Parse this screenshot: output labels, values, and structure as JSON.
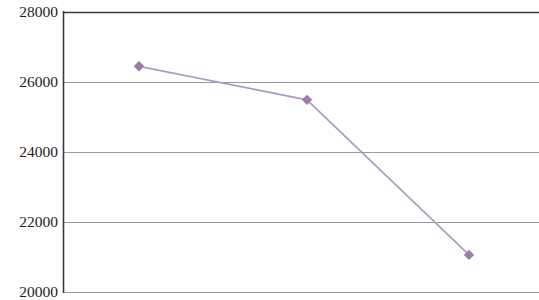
{
  "chart_data": {
    "type": "line",
    "title": "",
    "subtitle": "",
    "xlabel": "",
    "ylabel": "",
    "x": [
      1,
      2,
      3
    ],
    "values": [
      26450,
      25490,
      21060
    ],
    "series": [
      {
        "name": "",
        "values": [
          26450,
          25490,
          21060
        ]
      }
    ],
    "ytick_labels": [
      "28000",
      "26000",
      "24000",
      "22000",
      "20000"
    ],
    "ytick_values": [
      28000,
      26000,
      24000,
      22000,
      20000
    ],
    "xtick_labels": [],
    "ylim": [
      20000,
      28000
    ],
    "grid": "horizontal",
    "legend": "none",
    "line_color": "#b09cc0",
    "marker_color": "#9b7ba8",
    "marker_shape": "diamond",
    "axis_color": "#3a3a3a",
    "gridline_color": "#9a9a9a",
    "text_color": "#1d1d1d",
    "background_color": "#ffffff",
    "annotations": []
  },
  "axis": {
    "y_labels": [
      {
        "text": "28000",
        "value": 28000,
        "y": 12
      },
      {
        "text": "26000",
        "value": 26000,
        "y": 82
      },
      {
        "text": "24000",
        "value": 24000,
        "y": 152
      },
      {
        "text": "22000",
        "value": 22000,
        "y": 222
      },
      {
        "text": "20000",
        "value": 20000,
        "y": 292
      }
    ]
  }
}
